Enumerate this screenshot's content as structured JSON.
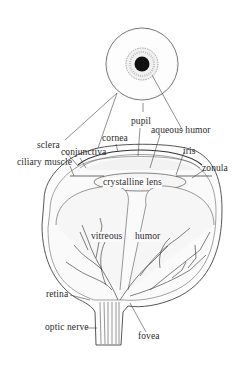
{
  "diagram": {
    "views": [
      "front view of eye",
      "cross-section of eyeball"
    ],
    "labels": {
      "pupil": "pupil",
      "aqueous_humor": "aqueous humor",
      "cornea": "cornea",
      "sclera": "sclera",
      "conjunctiva": "conjunctiva",
      "iris": "iris",
      "ciliary_muscle": "ciliary muscle",
      "zonula": "zonula",
      "crystalline_lens": "crystalline lens",
      "vitreous": "vitreous",
      "humor": "humor",
      "retina": "retina",
      "optic_nerve": "optic nerve",
      "fovea": "fovea"
    },
    "colors": {
      "ink": "#2a2a2a",
      "line": "#3a3a3a",
      "pupil": "#111111",
      "iris": "#9a9a9a",
      "background": "#ffffff"
    }
  }
}
